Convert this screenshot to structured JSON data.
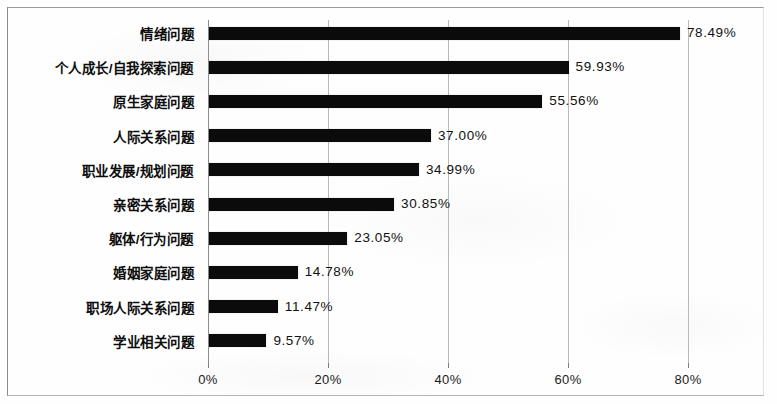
{
  "chart_data": {
    "type": "bar",
    "orientation": "horizontal",
    "title": "",
    "subtitle": "",
    "xlabel": "",
    "ylabel": "",
    "categories": [
      "情绪问题",
      "个人成长/自我探索问题",
      "原生家庭问题",
      "人际关系问题",
      "职业发展/规划问题",
      "亲密关系问题",
      "躯体/行为问题",
      "婚姻家庭问题",
      "职场人际关系问题",
      "学业相关问题"
    ],
    "values": [
      78.49,
      59.93,
      55.56,
      37.0,
      34.99,
      30.85,
      23.05,
      14.78,
      11.47,
      9.57
    ],
    "value_labels": [
      "78.49%",
      "59.93%",
      "55.56%",
      "37.00%",
      "34.99%",
      "30.85%",
      "23.05%",
      "14.78%",
      "11.47%",
      "9.57%"
    ],
    "xlim": [
      0,
      88
    ],
    "xticks": [
      0,
      20,
      40,
      60,
      80
    ],
    "xtick_labels": [
      "0%",
      "20%",
      "40%",
      "60%",
      "80%"
    ],
    "grid": true,
    "grid_axis": "x",
    "legend": false,
    "legend_position": "none",
    "bar_color": "#0b0b0b",
    "grid_color": "#b9b9b9",
    "axis_color": "#8d8d8d",
    "background_color": "#fefefe",
    "frame_color": "#8a8a8a"
  }
}
